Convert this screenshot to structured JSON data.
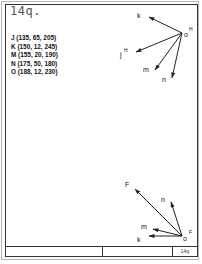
{
  "sheet": {
    "problem_number": "14q.",
    "title_block": {
      "cell_1": "",
      "cell_2": "",
      "cell_3": "14q."
    }
  },
  "given_points": [
    {
      "label": "J",
      "coords": "J (135, 65, 205)"
    },
    {
      "label": "K",
      "coords": "K (150, 12, 245)"
    },
    {
      "label": "M",
      "coords": "M (155, 20, 190)"
    },
    {
      "label": "N",
      "coords": "N (175, 50, 180)"
    },
    {
      "label": "O",
      "coords": "O (188, 12, 230)"
    }
  ],
  "top_view": {
    "origin_label": "o",
    "origin_superscript": "H",
    "vectors": [
      {
        "label": "k",
        "superscript": ""
      },
      {
        "label": "j",
        "superscript": "H"
      },
      {
        "label": "m",
        "superscript": ""
      },
      {
        "label": "n",
        "superscript": ""
      }
    ]
  },
  "front_view": {
    "origin_label": "o",
    "origin_superscript": "F",
    "vectors": [
      {
        "label": "F",
        "superscript": ""
      },
      {
        "label": "n",
        "superscript": ""
      },
      {
        "label": "m",
        "superscript": ""
      },
      {
        "label": "k",
        "superscript": ""
      }
    ]
  },
  "colors": {
    "line": "#222222",
    "text": "#111111",
    "title_text": "#555555",
    "outer_border": "#b8b8b8"
  }
}
